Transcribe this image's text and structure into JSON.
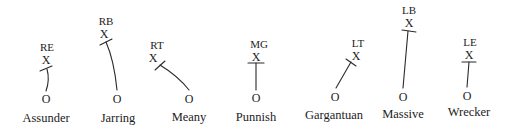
{
  "diagram": {
    "type": "blocking-assignment-diagram",
    "defender_symbol": "X",
    "blocker_symbol": "O",
    "ink_color": "#1c1c1c",
    "background": "#ffffff",
    "players": [
      {
        "position": "RE",
        "name": "Assunder"
      },
      {
        "position": "RB",
        "name": "Jarring"
      },
      {
        "position": "RT",
        "name": "Meany"
      },
      {
        "position": "MG",
        "name": "Punnish"
      },
      {
        "position": "LT",
        "name": "Gargantuan"
      },
      {
        "position": "LB",
        "name": "Massive"
      },
      {
        "position": "LE",
        "name": "Wrecker"
      }
    ]
  }
}
